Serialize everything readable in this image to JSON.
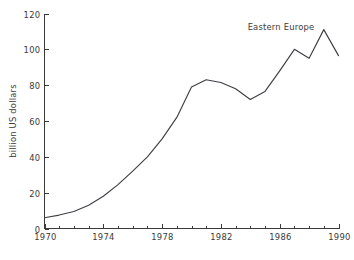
{
  "chart_data": {
    "type": "line",
    "title": "",
    "annotation": "Eastern Europe",
    "xlabel": "",
    "ylabel": "billion US dollars",
    "xlim": [
      1970,
      1990
    ],
    "ylim": [
      0,
      120
    ],
    "grid": false,
    "legend_position": "none",
    "x_major_ticks": [
      1970,
      1974,
      1978,
      1982,
      1986,
      1990
    ],
    "x_major_tick_labels": [
      "1970",
      "1974",
      "1978",
      "1982",
      "1986",
      "1990"
    ],
    "x_minor_tick_step": 1,
    "y_ticks": [
      0,
      20,
      40,
      60,
      80,
      100,
      120
    ],
    "y_tick_labels": [
      "0",
      "20",
      "40",
      "60",
      "80",
      "100",
      "120"
    ],
    "series": [
      {
        "name": "Eastern Europe",
        "color": "#3f3f45",
        "x": [
          1970,
          1971,
          1972,
          1973,
          1974,
          1975,
          1976,
          1977,
          1978,
          1979,
          1980,
          1981,
          1982,
          1983,
          1984,
          1985,
          1986,
          1987,
          1988,
          1989,
          1990
        ],
        "values": [
          6,
          7.5,
          9.5,
          13,
          18,
          24.5,
          32,
          40,
          50,
          62,
          79,
          83,
          81.5,
          78,
          72,
          76.5,
          88,
          100,
          95,
          111,
          96.5
        ]
      }
    ]
  },
  "annotations": {
    "series_label": "Eastern Europe"
  }
}
